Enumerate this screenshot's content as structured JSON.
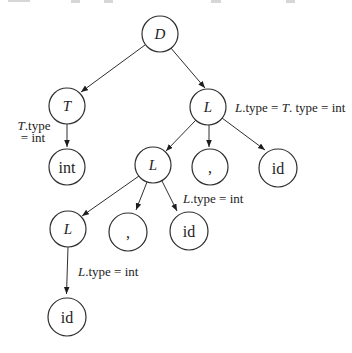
{
  "figure": {
    "type": "annotated-parse-tree",
    "colors": {
      "background": "#ffffff",
      "line": "#2f2f2f",
      "text": "#1d1d1d"
    }
  },
  "nodes": {
    "d": {
      "label": "D",
      "x": 160,
      "y": 34,
      "r": 18
    },
    "t": {
      "label": "T",
      "x": 67,
      "y": 106,
      "r": 18
    },
    "l1": {
      "label": "L",
      "x": 208,
      "y": 107,
      "r": 18
    },
    "int1": {
      "label": "int",
      "x": 67,
      "y": 167,
      "r": 18
    },
    "l2": {
      "label": "L",
      "x": 153,
      "y": 165,
      "r": 18
    },
    "comma1": {
      "label": ",",
      "x": 210,
      "y": 167,
      "r": 18
    },
    "id1": {
      "label": "id",
      "x": 278,
      "y": 168,
      "r": 19
    },
    "l3": {
      "label": "L",
      "x": 68,
      "y": 229,
      "r": 18
    },
    "comma2": {
      "label": ",",
      "x": 128,
      "y": 232,
      "r": 19
    },
    "id2": {
      "label": "id",
      "x": 189,
      "y": 231,
      "r": 19
    },
    "id3": {
      "label": "id",
      "x": 67,
      "y": 317,
      "r": 19
    }
  },
  "edges": {
    "d_t": {
      "x1": 145,
      "y1": 45,
      "x2": 81,
      "y2": 92
    },
    "d_l1": {
      "x1": 170,
      "y1": 47,
      "x2": 205,
      "y2": 88
    },
    "t_int": {
      "x1": 67,
      "y1": 124,
      "x2": 67,
      "y2": 147
    },
    "l1_l2": {
      "x1": 196,
      "y1": 120,
      "x2": 166,
      "y2": 151
    },
    "l1_comma1": {
      "x1": 209,
      "y1": 125,
      "x2": 209,
      "y2": 147
    },
    "l1_id1": {
      "x1": 222,
      "y1": 118,
      "x2": 265,
      "y2": 150
    },
    "l2_l3": {
      "x1": 139,
      "y1": 176,
      "x2": 82,
      "y2": 216
    },
    "l2_comma2": {
      "x1": 147,
      "y1": 182,
      "x2": 136,
      "y2": 210
    },
    "l2_id2": {
      "x1": 162,
      "y1": 181,
      "x2": 177,
      "y2": 211
    },
    "l3_id3": {
      "x1": 68,
      "y1": 247,
      "x2": 66.5,
      "y2": 294
    }
  },
  "annotations": {
    "t_attr": {
      "var": "T",
      "rest": ".type",
      "line2": "= int",
      "x1": 34,
      "y1": 130,
      "x2": 33,
      "y2": 142
    },
    "l1_attr": {
      "var1": "L",
      "mid": ".type = ",
      "var2": "T",
      "rest": ". type = int",
      "x": 235,
      "y": 112
    },
    "l2_attr": {
      "var": "L",
      "rest": ".type = int",
      "x": 183,
      "y": 203
    },
    "l3_attr": {
      "var": "L",
      "rest": ".type = int",
      "x": 78,
      "y": 276
    }
  }
}
